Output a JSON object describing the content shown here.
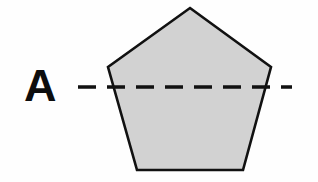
{
  "figure": {
    "canvas": {
      "width": 318,
      "height": 182
    },
    "background_color": "#fefefe",
    "label": {
      "text": "A",
      "x": 24,
      "y": 101,
      "font_size": 45,
      "color": "#0d0d0d"
    },
    "shape": {
      "name": "pentagon",
      "sides": 5,
      "fill_color": "#d2d2d2",
      "stroke_color": "#111111",
      "stroke_width": 2.6,
      "points": "190,8 271,67 243,170 137,170 108,67",
      "vertices": [
        {
          "label": "top",
          "x": 190,
          "y": 8
        },
        {
          "label": "right",
          "x": 271,
          "y": 67
        },
        {
          "label": "bottom-right",
          "x": 243,
          "y": 170
        },
        {
          "label": "bottom-left",
          "x": 137,
          "y": 170
        },
        {
          "label": "left",
          "x": 108,
          "y": 67
        }
      ]
    },
    "symmetry_line": {
      "name": "horizontal-dashed-line",
      "orientation": "horizontal",
      "x1": 78,
      "x2": 292,
      "y": 87,
      "color": "#111111",
      "stroke_width": 3.4,
      "dash_pattern": "18 11"
    }
  }
}
